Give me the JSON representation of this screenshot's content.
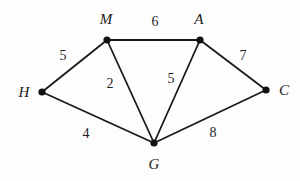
{
  "figure": {
    "type": "weighted-undirected-graph",
    "background_color": "#fdfdfd",
    "stroke_color": "#1a1a1a",
    "node_fill_color": "#111111",
    "width": 300,
    "height": 181
  },
  "nodes": [
    {
      "id": "H",
      "label": "H",
      "x": 42,
      "y": 92,
      "label_x": 24,
      "label_y": 92
    },
    {
      "id": "M",
      "label": "M",
      "x": 107,
      "y": 40,
      "label_x": 106,
      "label_y": 19
    },
    {
      "id": "A",
      "label": "A",
      "x": 200,
      "y": 40,
      "label_x": 199,
      "label_y": 19
    },
    {
      "id": "C",
      "label": "C",
      "x": 266,
      "y": 90,
      "label_x": 284,
      "label_y": 90
    },
    {
      "id": "G",
      "label": "G",
      "x": 154,
      "y": 143,
      "label_x": 154,
      "label_y": 164
    }
  ],
  "edges": [
    {
      "from": "H",
      "to": "M",
      "weight": "5",
      "label_x": 63,
      "label_y": 56
    },
    {
      "from": "M",
      "to": "A",
      "weight": "6",
      "label_x": 155,
      "label_y": 22
    },
    {
      "from": "A",
      "to": "C",
      "weight": "7",
      "label_x": 243,
      "label_y": 56
    },
    {
      "from": "H",
      "to": "G",
      "weight": "4",
      "label_x": 86,
      "label_y": 134
    },
    {
      "from": "M",
      "to": "G",
      "weight": "2",
      "label_x": 110,
      "label_y": 84
    },
    {
      "from": "A",
      "to": "G",
      "weight": "5",
      "label_x": 171,
      "label_y": 79
    },
    {
      "from": "G",
      "to": "C",
      "weight": "8",
      "label_x": 213,
      "label_y": 133
    }
  ]
}
